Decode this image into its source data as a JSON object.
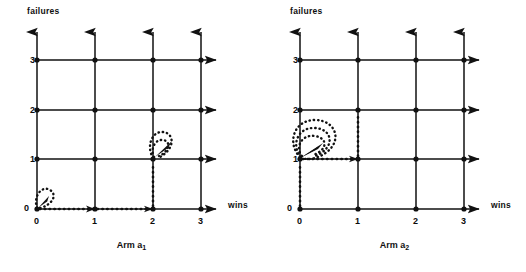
{
  "figure": {
    "type": "state-transition-lattice-pair",
    "background": "#ffffff",
    "line_color": "#111111",
    "panels": [
      {
        "id": "arm-1",
        "caption_prefix": "Arm",
        "caption_symbol": "a",
        "caption_index": "1",
        "caption_full": "Arm a1",
        "y_axis_label": "failures",
        "x_axis_label": "wins",
        "x_ticks": [
          "0",
          "1",
          "2",
          "3"
        ],
        "y_ticks": [
          "0",
          "1",
          "2",
          "3"
        ],
        "self_loops": [
          {
            "x": 0,
            "y": 0,
            "count": 1
          },
          {
            "x": 2,
            "y": 1,
            "count": 1
          }
        ],
        "path_segments": [
          {
            "from_x": 0,
            "from_y": 0,
            "to_x": 2,
            "to_y": 0,
            "style": "dotted",
            "orientation": "horizontal"
          },
          {
            "from_x": 2,
            "from_y": 0,
            "to_x": 2,
            "to_y": 1,
            "style": "dotted",
            "orientation": "vertical"
          }
        ]
      },
      {
        "id": "arm-2",
        "caption_prefix": "Arm",
        "caption_symbol": "a",
        "caption_index": "2",
        "caption_full": "Arm a2",
        "y_axis_label": "failures",
        "x_axis_label": "wins",
        "x_ticks": [
          "0",
          "1",
          "2",
          "3"
        ],
        "y_ticks": [
          "0",
          "1",
          "2",
          "3"
        ],
        "self_loops": [
          {
            "x": 0,
            "y": 1,
            "count": 3
          }
        ],
        "path_segments": [
          {
            "from_x": 0,
            "from_y": 0,
            "to_x": 0,
            "to_y": 1,
            "style": "dotted",
            "orientation": "vertical"
          },
          {
            "from_x": 0,
            "from_y": 1,
            "to_x": 1,
            "to_y": 1,
            "style": "dotted",
            "orientation": "horizontal"
          },
          {
            "from_x": 1,
            "from_y": 1,
            "to_x": 1,
            "to_y": 2,
            "style": "dotted",
            "orientation": "vertical"
          }
        ]
      }
    ]
  }
}
